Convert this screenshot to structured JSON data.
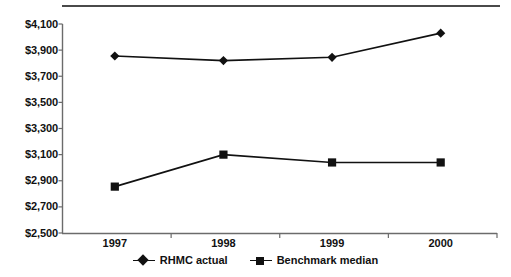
{
  "chart_data": {
    "type": "line",
    "title": "",
    "xlabel": "",
    "ylabel": "",
    "categories": [
      "1997",
      "1998",
      "1999",
      "2000"
    ],
    "ylim": [
      2500,
      4100
    ],
    "ytick_step": 200,
    "ytick_labels": [
      "$4,100",
      "$3,900",
      "$3,700",
      "$3,500",
      "$3,300",
      "$3,100",
      "$2,900",
      "$2,700",
      "$2,500"
    ],
    "ytick_values": [
      4100,
      3900,
      3700,
      3500,
      3300,
      3100,
      2900,
      2700,
      2500
    ],
    "grid": false,
    "legend_position": "bottom-center",
    "series": [
      {
        "name": "RHMC actual",
        "marker": "diamond",
        "color": "#111111",
        "values": [
          3855,
          3820,
          3845,
          4030
        ]
      },
      {
        "name": "Benchmark median",
        "marker": "square",
        "color": "#111111",
        "values": [
          2855,
          3100,
          3040,
          3040
        ]
      }
    ]
  },
  "legend": {
    "entries": [
      {
        "label": "RHMC actual",
        "marker": "diamond-marker-icon"
      },
      {
        "label": "Benchmark median",
        "marker": "square-marker-icon"
      }
    ]
  },
  "axes": {
    "y_labels": [
      "$4,100",
      "$3,900",
      "$3,700",
      "$3,500",
      "$3,300",
      "$3,100",
      "$2,900",
      "$2,700",
      "$2,500"
    ],
    "x_labels": [
      "1997",
      "1998",
      "1999",
      "2000"
    ]
  },
  "colors": {
    "line": "#111111",
    "axis": "#6b6b6b",
    "rule": "#4a4a4a",
    "background": "#ffffff",
    "text": "#111111"
  }
}
